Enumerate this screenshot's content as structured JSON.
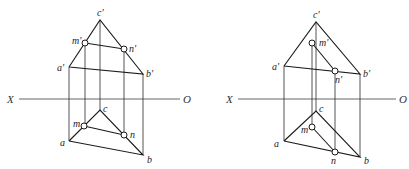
{
  "figures": [
    {
      "id": "left",
      "axis": {
        "left_label": "X",
        "right_label": "O"
      },
      "labels": {
        "c_prime": "c'",
        "m_prime": "m'",
        "n_prime": "n'",
        "a_prime": "a'",
        "b_prime": "b'",
        "c": "c",
        "m": "m",
        "n": "n",
        "a": "a",
        "b": "b"
      }
    },
    {
      "id": "right",
      "axis": {
        "left_label": "X",
        "right_label": "O"
      },
      "labels": {
        "c_prime": "c'",
        "m_prime": "m'",
        "n_prime": "n'",
        "a_prime": "a'",
        "b_prime": "b'",
        "c": "c",
        "m": "m",
        "n": "n",
        "a": "a",
        "b": "b"
      }
    }
  ]
}
